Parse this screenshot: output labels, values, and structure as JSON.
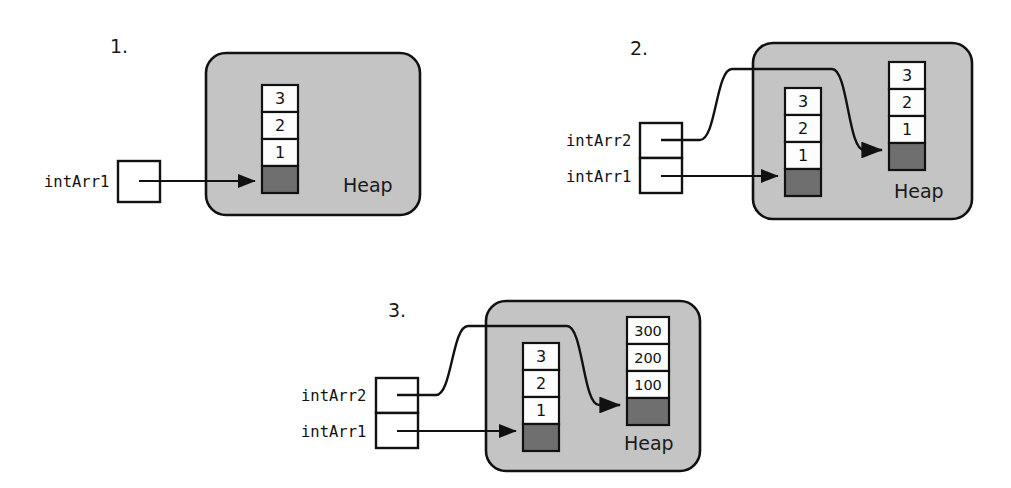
{
  "figure": {
    "heap_label": "Heap",
    "colors": {
      "heap_fill": "#c4c4c4",
      "cell_white": "#fdfdfd",
      "cell_dark": "#6f6f6f",
      "stroke": "#111111",
      "background": "#ffffff"
    }
  },
  "panels": [
    {
      "id": "panel-1",
      "number_label": "1.",
      "heap_label": "Heap",
      "variables": [
        {
          "name": "intArr1",
          "label": "intArr1",
          "points_to": "array-a"
        }
      ],
      "arrays": [
        {
          "id": "array-a",
          "cells": [
            "3",
            "2",
            "1"
          ],
          "pointer_cell": "",
          "pointer_cell_filled": true
        }
      ]
    },
    {
      "id": "panel-2",
      "number_label": "2.",
      "heap_label": "Heap",
      "variables": [
        {
          "name": "intArr2",
          "label": "intArr2",
          "points_to": "array-b"
        },
        {
          "name": "intArr1",
          "label": "intArr1",
          "points_to": "array-a"
        }
      ],
      "arrays": [
        {
          "id": "array-a",
          "cells": [
            "3",
            "2",
            "1"
          ],
          "pointer_cell": "",
          "pointer_cell_filled": true
        },
        {
          "id": "array-b",
          "cells": [
            "3",
            "2",
            "1"
          ],
          "pointer_cell": "",
          "pointer_cell_filled": true
        }
      ]
    },
    {
      "id": "panel-3",
      "number_label": "3.",
      "heap_label": "Heap",
      "variables": [
        {
          "name": "intArr2",
          "label": "intArr2",
          "points_to": "array-b"
        },
        {
          "name": "intArr1",
          "label": "intArr1",
          "points_to": "array-a"
        }
      ],
      "arrays": [
        {
          "id": "array-a",
          "cells": [
            "3",
            "2",
            "1"
          ],
          "pointer_cell": "",
          "pointer_cell_filled": true
        },
        {
          "id": "array-b",
          "cells": [
            "300",
            "200",
            "100"
          ],
          "pointer_cell": "",
          "pointer_cell_filled": true
        }
      ]
    }
  ]
}
